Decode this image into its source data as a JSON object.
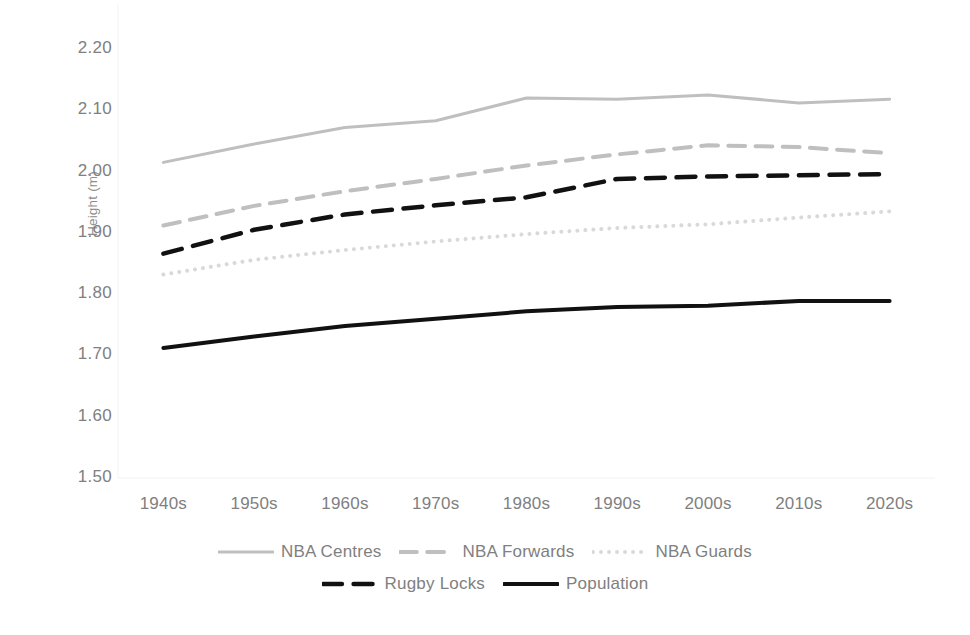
{
  "chart_data": {
    "type": "line",
    "title": "",
    "subtitle": "",
    "xlabel": "",
    "ylabel": "Height (m)",
    "categories": [
      "1940s",
      "1950s",
      "1960s",
      "1970s",
      "1980s",
      "1990s",
      "2000s",
      "2010s",
      "2020s"
    ],
    "ylim": [
      1.5,
      2.2
    ],
    "yticks": [
      "1.50",
      "1.60",
      "1.70",
      "1.80",
      "1.90",
      "2.00",
      "2.10",
      "2.20"
    ],
    "ytick_values": [
      1.5,
      1.6,
      1.7,
      1.8,
      1.9,
      2.0,
      2.1,
      2.2
    ],
    "grid": false,
    "legend_position": "bottom",
    "series": [
      {
        "name": "NBA Centres",
        "style": "solid",
        "color": "#bfbfbf",
        "width": 3,
        "values": [
          2.015,
          2.045,
          2.072,
          2.083,
          2.12,
          2.118,
          2.125,
          2.112,
          2.118
        ]
      },
      {
        "name": "NBA Forwards",
        "style": "dashed",
        "color": "#bfbfbf",
        "width": 4,
        "values": [
          1.912,
          1.944,
          1.968,
          1.988,
          2.01,
          2.028,
          2.043,
          2.04,
          2.03
        ]
      },
      {
        "name": "NBA Guards",
        "style": "dotted",
        "color": "#d9d9d9",
        "width": 4,
        "values": [
          1.832,
          1.856,
          1.872,
          1.886,
          1.898,
          1.908,
          1.914,
          1.925,
          1.935
        ]
      },
      {
        "name": "Rugby Locks",
        "style": "dashed",
        "color": "#111111",
        "width": 4.5,
        "values": [
          1.866,
          1.905,
          1.93,
          1.945,
          1.958,
          1.988,
          1.992,
          1.994,
          1.996
        ]
      },
      {
        "name": "Population",
        "style": "solid",
        "color": "#111111",
        "width": 4,
        "values": [
          1.712,
          1.731,
          1.748,
          1.76,
          1.772,
          1.779,
          1.781,
          1.789,
          1.789
        ]
      }
    ]
  },
  "axes": {
    "y_title": "Height (m)"
  }
}
